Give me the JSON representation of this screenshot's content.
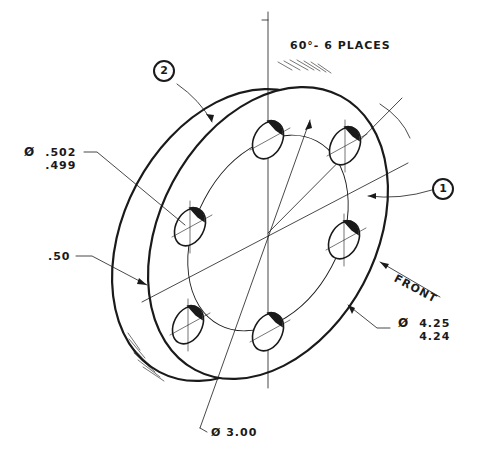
{
  "diagram": {
    "type": "isometric mechanical drawing",
    "annotations": {
      "angle_spacing": "60°- 6 PLACES",
      "hole_diameter": {
        "symbol": "Ø",
        "max": ".502",
        "min": ".499"
      },
      "thickness": ".50",
      "bolt_circle": {
        "symbol": "Ø",
        "value": "3.00"
      },
      "outer_diameter": {
        "symbol": "Ø",
        "max": "4.25",
        "min": "4.24"
      },
      "view_direction": "FRONT"
    },
    "balloons": [
      {
        "number": "1",
        "target": "front face"
      },
      {
        "number": "2",
        "target": "cylindrical edge"
      }
    ],
    "hole_count": 6,
    "colors": {
      "line": "#1a1a1a",
      "background": "#ffffff"
    }
  }
}
